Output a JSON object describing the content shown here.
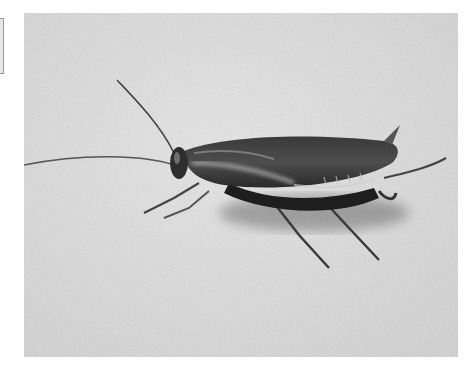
{
  "image": {
    "subject": "Cockroach on a light textured surface",
    "style": "grayscale photograph",
    "colors": {
      "page_background": "#ffffff",
      "surface": "#dcdcdc",
      "surface_light": "#e8e8e8",
      "body_dark": "#2b2b2b",
      "body_mid": "#5a5a5a",
      "highlight": "#cfcfcf",
      "edge_bracket": "#9a9a9a"
    },
    "alt_text": "Black and white photo of a cockroach walking on a pale surface, facing left, with long antennae"
  }
}
